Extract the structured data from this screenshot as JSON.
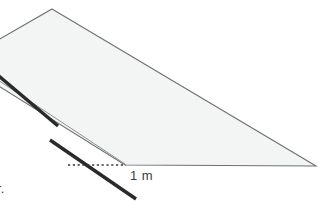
{
  "figure": {
    "background_color": "#ffffff",
    "width": 324,
    "height": 201
  },
  "labels": {
    "length": "1 m",
    "clipped_caption": "r."
  },
  "colors": {
    "surface_fill": "#f3f4f4",
    "surface_stroke": "#6e7173",
    "thick_line": "#2a2a2a",
    "thin_guide_line": "#8c8f91",
    "dotted_line": "#3a3a3a",
    "text": "#3a3a3a"
  },
  "geometry": {
    "surface_polygon": "52,9 316,166 125,165 -40,62",
    "thin_guide_line": {
      "x1": -40,
      "y1": 55,
      "x2": 125,
      "y2": 164
    },
    "thick_segment_upper": {
      "x1": -6,
      "y1": 72,
      "x2": 58,
      "y2": 126
    },
    "thick_segment_lower": {
      "x1": 50,
      "y1": 140,
      "x2": 136,
      "y2": 199
    },
    "dotted_line": {
      "x1": 68,
      "y1": 165,
      "x2": 126,
      "y2": 165
    }
  },
  "icons": {
    "surface": "inclined-plane-icon",
    "measure": "dimension-line-icon"
  }
}
